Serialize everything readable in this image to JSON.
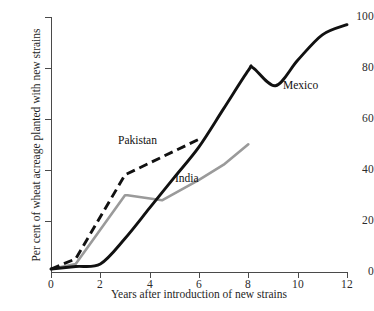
{
  "chart_data": {
    "type": "line",
    "title": "",
    "xlabel": "Years after introduction of new strains",
    "ylabel": "Per cent of wheat acreage planted with new strains",
    "xlim": [
      0,
      12
    ],
    "ylim": [
      0,
      100
    ],
    "xticks": [
      0,
      2,
      4,
      6,
      8,
      10,
      12
    ],
    "yticks": [
      0,
      20,
      40,
      60,
      80,
      100
    ],
    "xtick_labels": [
      "0",
      "2",
      "4",
      "6",
      "8",
      "10",
      "12"
    ],
    "ytick_labels": [
      "0",
      "20",
      "40",
      "60",
      "80",
      "100"
    ],
    "grid": false,
    "legend": "inline-annotations",
    "series": [
      {
        "name": "Mexico",
        "style": "solid",
        "color": "#111111",
        "smooth": true,
        "x": [
          0,
          1,
          2,
          3,
          4,
          5,
          6,
          7,
          8,
          8.2,
          9.1,
          10,
          11,
          12
        ],
        "y": [
          1,
          2,
          3,
          13,
          25,
          37,
          49,
          64,
          79,
          80,
          73,
          83,
          93,
          97
        ]
      },
      {
        "name": "Pakistan",
        "style": "dashed",
        "color": "#111111",
        "smooth": false,
        "x": [
          0,
          1,
          3,
          6
        ],
        "y": [
          1,
          5,
          38,
          52
        ]
      },
      {
        "name": "India",
        "style": "solid",
        "color": "#9a9a9a",
        "smooth": false,
        "x": [
          0,
          1,
          3,
          3.1,
          4.5,
          6,
          7,
          8
        ],
        "y": [
          1,
          3,
          30,
          30,
          28,
          36,
          42,
          50
        ]
      }
    ],
    "annotations": [
      {
        "text": "Pakistan",
        "x": 2.7,
        "y": 55
      },
      {
        "text": "India",
        "x": 5.0,
        "y": 39
      },
      {
        "text": "Mexico",
        "x": 9.4,
        "y": 76
      }
    ]
  }
}
